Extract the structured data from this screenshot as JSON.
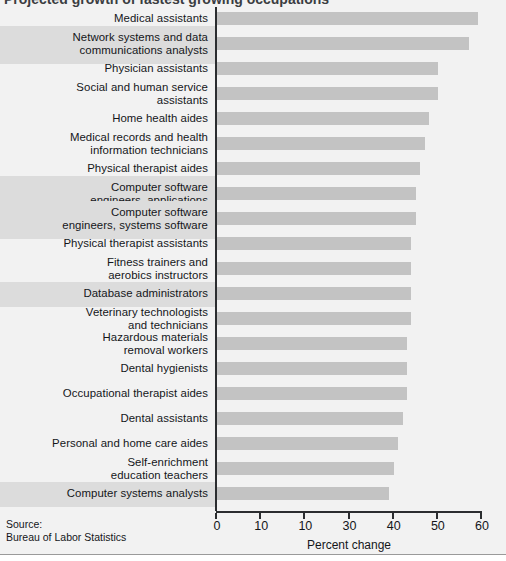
{
  "figure": {
    "title_clipped": "Projected growth of fastest growing occupations",
    "source_label": "Source:",
    "source_name": "Bureau of Labor Statistics"
  },
  "chart_data": {
    "type": "bar",
    "orientation": "horizontal",
    "title": "",
    "xlabel": "Percent change",
    "ylabel": "",
    "xlim": [
      0,
      60
    ],
    "xticks": [
      0,
      10,
      20,
      30,
      40,
      50,
      60
    ],
    "xtick_labels": [
      "0",
      "10",
      "10",
      "30",
      "40",
      "50",
      "60"
    ],
    "grid": false,
    "legend": null,
    "bar_color": "#c3c3c3",
    "band_color": "#dcdcdc",
    "background_color": "#f2f2f2",
    "axis_color": "#2b2d30",
    "categories": [
      "Medical assistants",
      "Network systems and data communications analysts",
      "Physician assistants",
      "Social and human service assistants",
      "Home health aides",
      "Medical records and health information technicians",
      "Physical therapist aides",
      "Computer software engineers, applications",
      "Computer software engineers, systems software",
      "Physical therapist assistants",
      "Fitness trainers and aerobics instructors",
      "Database administrators",
      "Veterinary technologists and technicians",
      "Hazardous materials removal workers",
      "Dental hygienists",
      "Occupational therapist aides",
      "Dental assistants",
      "Personal and home care aides",
      "Self-enrichment education teachers",
      "Computer systems analysts"
    ],
    "values": [
      59,
      57,
      50,
      50,
      48,
      47,
      46,
      45,
      45,
      44,
      44,
      44,
      44,
      43,
      43,
      43,
      42,
      41,
      40,
      39
    ]
  },
  "rows": [
    {
      "label_line1": "Medical assistants",
      "label_line2": "",
      "value": 59,
      "band": false
    },
    {
      "label_line1": "Network systems and data",
      "label_line2": "communications analysts",
      "value": 57,
      "band": true
    },
    {
      "label_line1": "Physician assistants",
      "label_line2": "",
      "value": 50,
      "band": false
    },
    {
      "label_line1": "Social and human service",
      "label_line2": "assistants",
      "value": 50,
      "band": false
    },
    {
      "label_line1": "Home health aides",
      "label_line2": "",
      "value": 48,
      "band": false
    },
    {
      "label_line1": "Medical records and health",
      "label_line2": "information technicians",
      "value": 47,
      "band": false
    },
    {
      "label_line1": "Physical therapist aides",
      "label_line2": "",
      "value": 46,
      "band": false
    },
    {
      "label_line1": "Computer software",
      "label_line2": "engineers, applications",
      "value": 45,
      "band": true
    },
    {
      "label_line1": "Computer software",
      "label_line2": "engineers, systems software",
      "value": 45,
      "band": true
    },
    {
      "label_line1": "Physical therapist assistants",
      "label_line2": "",
      "value": 44,
      "band": false
    },
    {
      "label_line1": "Fitness trainers and",
      "label_line2": "aerobics instructors",
      "value": 44,
      "band": false
    },
    {
      "label_line1": "Database administrators",
      "label_line2": "",
      "value": 44,
      "band": true
    },
    {
      "label_line1": "Veterinary technologists",
      "label_line2": "and technicians",
      "value": 44,
      "band": false
    },
    {
      "label_line1": "Hazardous materials",
      "label_line2": "removal workers",
      "value": 43,
      "band": false
    },
    {
      "label_line1": "Dental hygienists",
      "label_line2": "",
      "value": 43,
      "band": false
    },
    {
      "label_line1": "Occupational therapist aides",
      "label_line2": "",
      "value": 43,
      "band": false
    },
    {
      "label_line1": "Dental assistants",
      "label_line2": "",
      "value": 42,
      "band": false
    },
    {
      "label_line1": "Personal and home care aides",
      "label_line2": "",
      "value": 41,
      "band": false
    },
    {
      "label_line1": "Self-enrichment",
      "label_line2": "education teachers",
      "value": 40,
      "band": false
    },
    {
      "label_line1": "Computer systems analysts",
      "label_line2": "",
      "value": 39,
      "band": true
    }
  ]
}
